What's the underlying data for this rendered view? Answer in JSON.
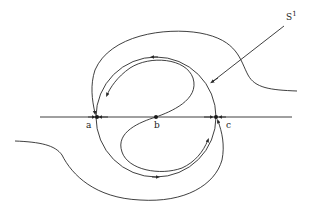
{
  "diagram": {
    "labels": {
      "a": "a",
      "b": "b",
      "c": "c",
      "s1_base": "S",
      "s1_sup": "1"
    },
    "points": [
      {
        "name": "a",
        "x": 97,
        "y": 117
      },
      {
        "name": "b",
        "x": 156,
        "y": 117
      },
      {
        "name": "c",
        "x": 216,
        "y": 117
      }
    ],
    "colors": {
      "stroke": "#2a2a2a",
      "background": "#ffffff"
    }
  }
}
